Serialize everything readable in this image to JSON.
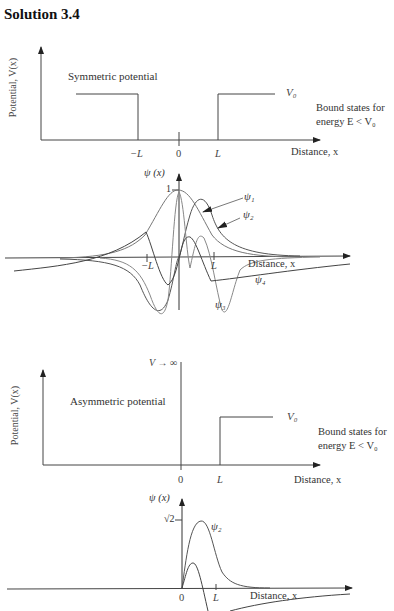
{
  "page": {
    "top_cut_text": "",
    "title": "Solution 3.4"
  },
  "symmetric": {
    "caption": "Symmetric potential",
    "ylabel": "Potential, V(x)",
    "xlabel": "Distance, x",
    "v0_label": "V₀",
    "bound_line1": "Bound states for",
    "bound_line2": "energy E < V₀",
    "ticks": {
      "neg_L": "−L",
      "zero": "0",
      "L": "L"
    }
  },
  "symmetric_wave": {
    "ylabel": "ψ (x)",
    "y_tick": "1",
    "xlabel": "Distance, x",
    "ticks": {
      "neg_L": "−L",
      "L": "L"
    },
    "curves": [
      "ψ₁",
      "ψ₂",
      "ψ₃",
      "ψ₄"
    ]
  },
  "asymmetric": {
    "caption": "Asymmetric potential",
    "ylabel": "Potential, V(x)",
    "xlabel": "Distance, x",
    "wall_label": "V → ∞",
    "v0_label": "V₀",
    "bound_line1": "Bound states for",
    "bound_line2": "energy E < V₀",
    "ticks": {
      "zero": "0",
      "L": "L"
    }
  },
  "asymmetric_wave": {
    "ylabel": "ψ (x)",
    "y_tick": "√2",
    "xlabel": "Distance, x",
    "ticks": {
      "zero": "0",
      "L": "L"
    },
    "curves": [
      "ψ₂"
    ]
  }
}
